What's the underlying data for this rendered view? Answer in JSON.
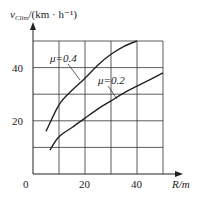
{
  "chart_data": {
    "type": "line",
    "title": "",
    "ylabel_main": "v",
    "ylabel_sub": "Clim",
    "ylabel_unit": "/(km · h⁻¹)",
    "xlabel": "R/m",
    "xlim": [
      0,
      50
    ],
    "ylim": [
      0,
      50
    ],
    "x_ticks": [
      "0",
      "20",
      "40"
    ],
    "y_ticks": [
      "20",
      "40"
    ],
    "grid": true,
    "series": [
      {
        "name": "μ=0.4",
        "x": [
          5,
          10,
          15,
          20,
          25,
          30,
          35,
          40
        ],
        "y": [
          16,
          26,
          31.5,
          36,
          41,
          45,
          48,
          50
        ]
      },
      {
        "name": "μ=0.2",
        "x": [
          6.5,
          10,
          15,
          20,
          25,
          30,
          35,
          40,
          45,
          50
        ],
        "y": [
          9,
          14,
          17.5,
          21,
          24.5,
          27.5,
          30.5,
          33,
          35.5,
          38
        ]
      }
    ],
    "annotations": [
      "μ=0.4",
      "μ=0.2"
    ],
    "colors": {
      "line": "#222222",
      "grid": "#333333"
    }
  }
}
